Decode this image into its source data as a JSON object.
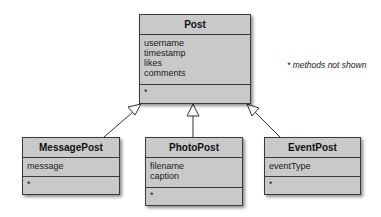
{
  "diagram": {
    "type": "UML class diagram",
    "note": "* methods not shown",
    "classes": {
      "post": {
        "name": "Post",
        "attributes": [
          "username",
          "timestamp",
          "likes",
          "comments"
        ],
        "methods": "*"
      },
      "message_post": {
        "name": "MessagePost",
        "attributes": [
          "message"
        ],
        "methods": "*"
      },
      "photo_post": {
        "name": "PhotoPost",
        "attributes": [
          "filename",
          "caption"
        ],
        "methods": "*"
      },
      "event_post": {
        "name": "EventPost",
        "attributes": [
          "eventType"
        ],
        "methods": "*"
      }
    },
    "relationships": [
      {
        "type": "inheritance",
        "from": "MessagePost",
        "to": "Post"
      },
      {
        "type": "inheritance",
        "from": "PhotoPost",
        "to": "Post"
      },
      {
        "type": "inheritance",
        "from": "EventPost",
        "to": "Post"
      }
    ],
    "colors": {
      "box_fill": "#c9c9c9",
      "border": "#3a3a3a"
    }
  }
}
